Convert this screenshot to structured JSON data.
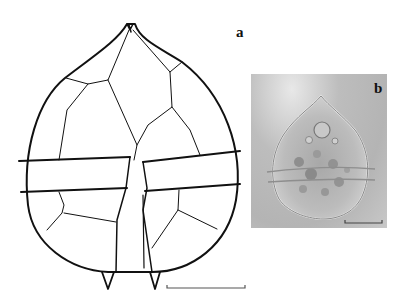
{
  "figure": {
    "panels": [
      {
        "label": "a",
        "type": "line drawing",
        "description": "Dinoflagellate cyst plate tabulation drawing with cingulum and apical horn"
      },
      {
        "label": "b",
        "type": "light micrograph",
        "description": "Cyst with granular contents"
      }
    ],
    "scale_bars": [
      {
        "panel": "a",
        "x1": 167,
        "x2": 245,
        "y": 287
      },
      {
        "panel": "b",
        "x1": 345,
        "x2": 382,
        "y": 223
      }
    ],
    "colors": {
      "line": "#111111",
      "photo_bg": "#b8b8b8",
      "scale_bar": "#555555"
    }
  }
}
